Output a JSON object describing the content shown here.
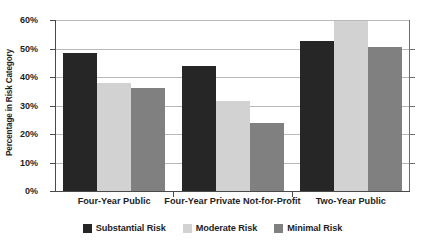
{
  "chart_data": {
    "type": "bar",
    "title": "",
    "xlabel": "",
    "ylabel": "Percentage in Risk Category",
    "categories": [
      "Four-Year Public",
      "Four-Year Private Not-for-Profit",
      "Two-Year Public"
    ],
    "series": [
      {
        "name": "Substantial Risk",
        "color": "#262626",
        "values": [
          48.5,
          44.0,
          52.5
        ]
      },
      {
        "name": "Moderate Risk",
        "color": "#d2d2d2",
        "values": [
          37.8,
          31.5,
          59.5
        ]
      },
      {
        "name": "Minimal Risk",
        "color": "#808080",
        "values": [
          36.3,
          23.9,
          50.5
        ]
      }
    ],
    "ylim": [
      0,
      60
    ],
    "ytick_values": [
      0,
      10,
      20,
      30,
      40,
      50,
      60
    ],
    "ytick_labels": [
      "0%",
      "10%",
      "20%",
      "30%",
      "40%",
      "50%",
      "60%"
    ],
    "grid": true,
    "legend_position": "bottom"
  }
}
